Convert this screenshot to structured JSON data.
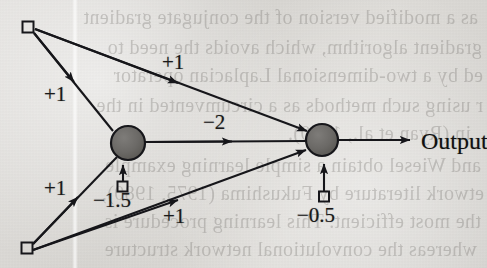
{
  "figure": {
    "type": "neural-network-diagram",
    "output_label": "Output"
  },
  "nodes": {
    "input_top": {
      "name": "input-1",
      "shape": "square",
      "x": 28,
      "y": 27
    },
    "input_bottom": {
      "name": "input-2",
      "shape": "square",
      "x": 27,
      "y": 248
    },
    "hidden": {
      "name": "hidden-unit",
      "shape": "circle",
      "x": 128,
      "y": 143,
      "r": 17
    },
    "output": {
      "name": "output-unit",
      "shape": "circle",
      "x": 322,
      "y": 140,
      "r": 16
    },
    "bias_hidden": {
      "name": "bias-hidden",
      "shape": "square",
      "x": 122,
      "y": 186
    },
    "bias_output": {
      "name": "bias-output",
      "shape": "square",
      "x": 324,
      "y": 196
    }
  },
  "edges": [
    {
      "id": "in1-hidden",
      "from": "input_top",
      "to": "hidden",
      "weight": "+1"
    },
    {
      "id": "in1-output",
      "from": "input_top",
      "to": "output",
      "weight": "+1"
    },
    {
      "id": "in2-hidden",
      "from": "input_bottom",
      "to": "hidden",
      "weight": "+1"
    },
    {
      "id": "in2-output",
      "from": "input_bottom",
      "to": "output",
      "weight": "+1"
    },
    {
      "id": "hidden-output",
      "from": "hidden",
      "to": "output",
      "weight": "−2"
    },
    {
      "id": "bias-hidden-edge",
      "from": "bias_hidden",
      "to": "hidden",
      "weight": "−1.5"
    },
    {
      "id": "bias-output-edge",
      "from": "bias_output",
      "to": "output",
      "weight": "−0.5"
    }
  ],
  "labels": {
    "w_in1_hidden": {
      "text": "+1",
      "x": 44,
      "y": 82
    },
    "w_in1_output": {
      "text": "+1",
      "x": 162,
      "y": 50
    },
    "w_in2_hidden": {
      "text": "+1",
      "x": 44,
      "y": 176
    },
    "w_in2_output": {
      "text": "+1",
      "x": 163,
      "y": 204
    },
    "w_hidden_output": {
      "text": "−2",
      "x": 203,
      "y": 110
    },
    "bias_hidden_value": {
      "text": "−1.5",
      "x": 93,
      "y": 188
    },
    "bias_output_value": {
      "text": "−0.5",
      "x": 297,
      "y": 203
    },
    "output_text": {
      "text": "Output",
      "x": 421,
      "y": 128
    }
  },
  "colors": {
    "paper": "#d9d7d4",
    "ink": "#1a1a1a",
    "node_fill": "#6e6c69",
    "node_stroke": "#17171a",
    "ghost_text": "#6d6a66"
  },
  "ghost_text_lines": [
    {
      "text": "as a modified version of the conjugate gradient",
      "x": 9,
      "y": 6
    },
    {
      "text": "gradient algorithm, which avoids the need to",
      "x": 5,
      "y": 36
    },
    {
      "text": "ed by a two-dimensional Laplacian operator",
      "x": 4,
      "y": 64
    },
    {
      "text": "r using such methods as a circumvented in the",
      "x": 4,
      "y": 94
    },
    {
      "text": "in (Ryan et al., 1990).",
      "x": 16,
      "y": 122
    },
    {
      "text": "and Wiesel obtain a simple learning example",
      "x": 6,
      "y": 154
    },
    {
      "text": "etwork literature by Fukushima (1975, 1980),",
      "x": 3,
      "y": 182
    },
    {
      "text": "the most efficient. This learning procedure is",
      "x": 6,
      "y": 210
    },
    {
      "text": "whereas the convolutional network structure",
      "x": 10,
      "y": 238
    }
  ]
}
